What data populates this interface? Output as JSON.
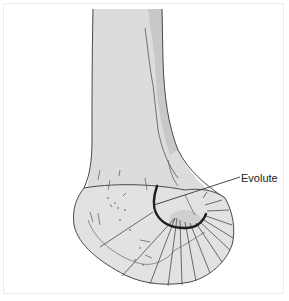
{
  "figure": {
    "annotations": [
      {
        "label": "Evolute",
        "target": "evolute-curve"
      }
    ]
  },
  "colors": {
    "bone_fill": "#dcdcdc",
    "bone_shadow": "#c4c4c4",
    "bone_outline": "#4a4a4a",
    "evolute_stroke": "#1e1e1e",
    "condyle_fill": "#e8e8e8",
    "frame_border": "#ececec"
  }
}
